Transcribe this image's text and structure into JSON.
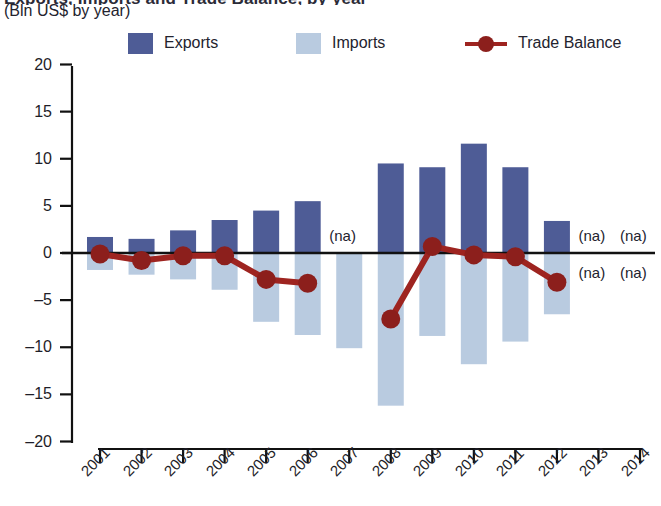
{
  "header": {
    "title_clipped": "Exports, Imports and Trade Balance, by year",
    "subtitle": "(Bln US$ by year)"
  },
  "legend": {
    "items": [
      {
        "label": "Exports",
        "color": "#4e5c96",
        "marker": "square"
      },
      {
        "label": "Imports",
        "color": "#b9cbe0",
        "marker": "square"
      },
      {
        "label": "Trade Balance",
        "color": "#9e2420",
        "marker": "line-circle"
      }
    ]
  },
  "na_labels": [
    {
      "text": "(na)",
      "year": "2007",
      "side": "above"
    },
    {
      "text": "(na)",
      "year": "2013",
      "side": "above"
    },
    {
      "text": "(na)",
      "year": "2014",
      "side": "above"
    },
    {
      "text": "(na)",
      "year": "2013",
      "side": "below"
    },
    {
      "text": "(na)",
      "year": "2014",
      "side": "below"
    }
  ],
  "chart_data": {
    "type": "bar",
    "title": "Exports, Imports and Trade Balance, by year",
    "subtitle": "(Bln US$ by year)",
    "xlabel": "",
    "ylabel": "",
    "unit": "Bln US$",
    "ylim": [
      -20,
      20
    ],
    "yticks": [
      20,
      15,
      10,
      5,
      0,
      -5,
      -10,
      -15,
      -20
    ],
    "ytick_labels": [
      "20",
      "15",
      "10",
      "5",
      "0",
      "–5",
      "–10",
      "–15",
      "–20"
    ],
    "grid": false,
    "legend_position": "top",
    "categories": [
      "2001",
      "2002",
      "2003",
      "2004",
      "2005",
      "2006",
      "2007",
      "2008",
      "2009",
      "2010",
      "2011",
      "2012",
      "2013",
      "2014"
    ],
    "series": [
      {
        "name": "Exports",
        "type": "bar",
        "color": "#4e5c96",
        "values": [
          1.7,
          1.5,
          2.4,
          3.5,
          4.5,
          5.5,
          null,
          9.5,
          9.1,
          11.6,
          9.1,
          3.4,
          null,
          null
        ]
      },
      {
        "name": "Imports",
        "type": "bar",
        "color": "#b9cbe0",
        "values": [
          -1.8,
          -2.3,
          -2.8,
          -3.9,
          -7.3,
          -8.7,
          -10.1,
          -16.2,
          -8.8,
          -11.8,
          -9.4,
          -6.5,
          null,
          null
        ]
      },
      {
        "name": "Trade Balance",
        "type": "line",
        "color": "#9e2420",
        "values": [
          -0.1,
          -0.8,
          -0.3,
          -0.3,
          -2.8,
          -3.2,
          null,
          -7.0,
          0.7,
          -0.2,
          -0.4,
          -3.1,
          null,
          null
        ]
      }
    ]
  }
}
